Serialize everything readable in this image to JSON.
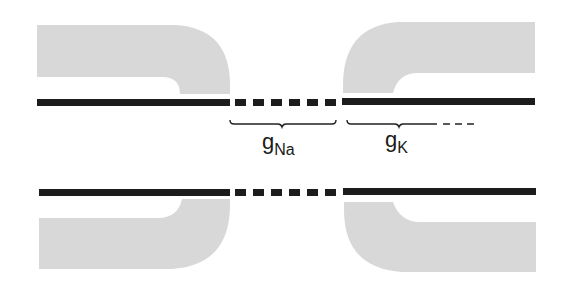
{
  "diagram": {
    "type": "membrane-channel-schematic",
    "colors": {
      "background": "#ffffff",
      "membrane_fill": "#d8d8d8",
      "line": "#1c1c1c",
      "brace": "#222222"
    },
    "labels": {
      "g_na": {
        "main": "g",
        "subscript": "Na"
      },
      "g_k": {
        "main": "g",
        "subscript": "K"
      }
    },
    "membranes": {
      "top": {
        "segments": [
          "solid",
          "dashed",
          "solid"
        ],
        "dash_count": 7
      },
      "bottom": {
        "segments": [
          "solid",
          "dashed",
          "solid"
        ],
        "dash_count": 7
      }
    }
  }
}
